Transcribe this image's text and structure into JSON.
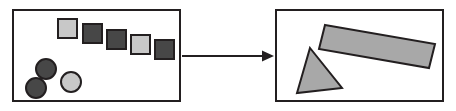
{
  "canvas": {
    "width": 456,
    "height": 111,
    "background": "#ffffff",
    "title": "",
    "stroke_color": "#231f20",
    "stroke_width": 2
  },
  "palette": {
    "light_gray": "#c8c8c8",
    "dark_gray": "#474747",
    "medium_gray": "#a8a8a8",
    "outline": "#231f20",
    "white": "#ffffff"
  },
  "panels": [
    {
      "id": "source-panel",
      "label": "",
      "x": 13,
      "y": 10,
      "width": 167,
      "height": 91,
      "fill": "#ffffff",
      "stroke": "#231f20"
    },
    {
      "id": "target-panel",
      "label": "",
      "x": 276,
      "y": 10,
      "width": 167,
      "height": 91,
      "fill": "#ffffff",
      "stroke": "#231f20"
    }
  ],
  "connector": {
    "id": "transform-arrow",
    "label": "",
    "direction": "right",
    "x1": 182,
    "y1": 56,
    "x2": 274,
    "y2": 56,
    "stroke": "#231f20",
    "stroke_width": 2,
    "head_length": 12,
    "head_width": 11
  },
  "source_shapes": {
    "squares": [
      {
        "name": "square-1",
        "x": 58,
        "y": 19,
        "size": 19,
        "fill": "#c8c8c8"
      },
      {
        "name": "square-2",
        "x": 83,
        "y": 24,
        "size": 19,
        "fill": "#474747"
      },
      {
        "name": "square-3",
        "x": 107,
        "y": 30,
        "size": 19,
        "fill": "#474747"
      },
      {
        "name": "square-4",
        "x": 131,
        "y": 35,
        "size": 19,
        "fill": "#c8c8c8"
      },
      {
        "name": "square-5",
        "x": 155,
        "y": 40,
        "size": 19,
        "fill": "#474747"
      }
    ],
    "circles": [
      {
        "name": "circle-1",
        "cx": 46,
        "cy": 69,
        "r": 10,
        "fill": "#474747"
      },
      {
        "name": "circle-2",
        "cx": 36,
        "cy": 88,
        "r": 10,
        "fill": "#474747"
      },
      {
        "name": "circle-3",
        "cx": 71,
        "cy": 82,
        "r": 10,
        "fill": "#c8c8c8"
      }
    ]
  },
  "target_shapes": {
    "triangle": {
      "name": "triangle",
      "points": "310,48 342,88 297,93",
      "fill": "#a8a8a8"
    },
    "rotated_rectangle": {
      "name": "rotated-rectangle",
      "points": "325,25 435,44 429,68 319,49",
      "fill": "#a8a8a8",
      "rotation_deg": -10
    }
  }
}
